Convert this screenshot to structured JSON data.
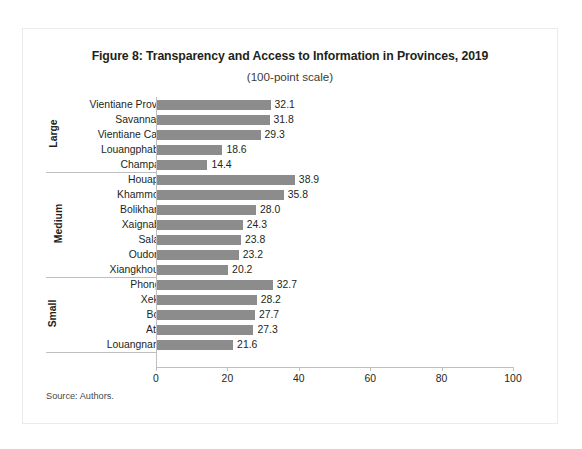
{
  "figure": {
    "title": "Figure 8: Transparency and Access to Information in Provinces, 2019",
    "subtitle": "(100-point scale)",
    "source": "Source: Authors."
  },
  "colors": {
    "bar": "#8c8c8c",
    "axis": "#bfbfbf",
    "text": "#231f20"
  },
  "chart_data": {
    "type": "bar",
    "orientation": "horizontal",
    "title": "Figure 8: Transparency and Access to Information in Provinces, 2019",
    "subtitle": "(100-point scale)",
    "xlabel": "",
    "ylabel": "",
    "xlim": [
      0,
      100
    ],
    "xticks": [
      "0",
      "20",
      "40",
      "60",
      "80",
      "100"
    ],
    "grid": false,
    "legend": false,
    "groups": [
      {
        "name": "Large",
        "categories": [
          "Vientiane Province",
          "Savannakhet",
          "Vientiane Capital",
          "Louangphabang",
          "Champasak"
        ],
        "values": [
          32.1,
          31.8,
          29.3,
          18.6,
          14.4
        ],
        "labels": [
          "32.1",
          "31.8",
          "29.3",
          "18.6",
          "14.4"
        ]
      },
      {
        "name": "Medium",
        "categories": [
          "Houaphan",
          "Khammouan",
          "Bolikhamxai",
          "Xaignabouli",
          "Salavan",
          "Oudomxai",
          "Xiangkhouang"
        ],
        "values": [
          38.9,
          35.8,
          28.0,
          24.3,
          23.8,
          23.2,
          20.2
        ],
        "labels": [
          "38.9",
          "35.8",
          "28.0",
          "24.3",
          "23.8",
          "23.2",
          "20.2"
        ]
      },
      {
        "name": "Small",
        "categories": [
          "Phongsali",
          "Xekong",
          "Bokeo",
          "Attapu",
          "Louangnamtha"
        ],
        "values": [
          32.7,
          28.2,
          27.7,
          27.3,
          21.6
        ],
        "labels": [
          "32.7",
          "28.2",
          "27.7",
          "27.3",
          "21.6"
        ]
      }
    ]
  }
}
